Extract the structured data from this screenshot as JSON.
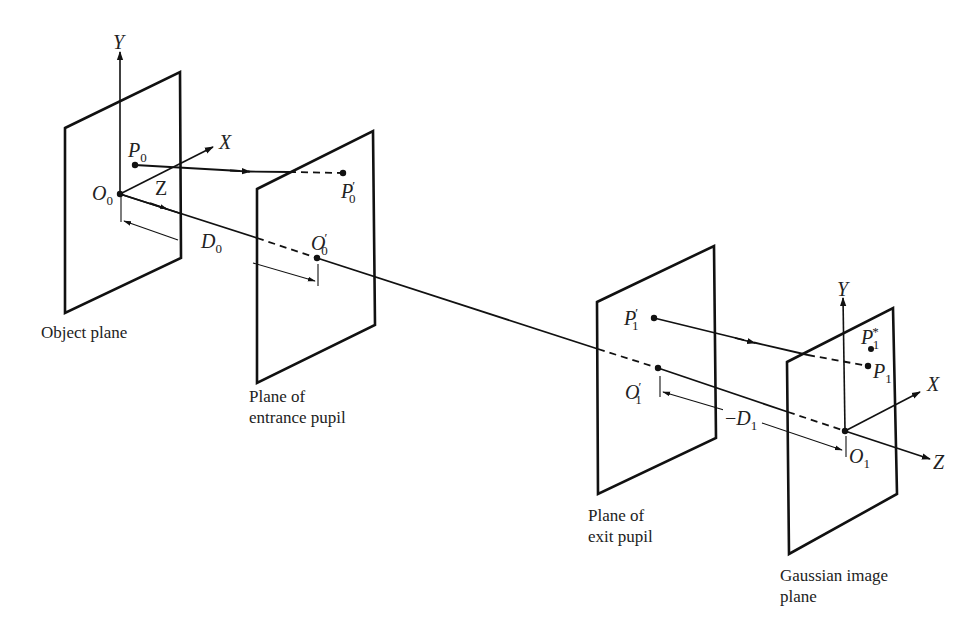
{
  "figure": {
    "type": "optical-system-schematic",
    "planes": [
      {
        "id": "object",
        "caption": "Object plane"
      },
      {
        "id": "entrance",
        "caption_line1": "Plane of",
        "caption_line2": "entrance pupil"
      },
      {
        "id": "exit",
        "caption_line1": "Plane of",
        "caption_line2": "exit pupil"
      },
      {
        "id": "image",
        "caption_line1": "Gaussian image",
        "caption_line2": "plane"
      }
    ],
    "object_axes": {
      "y": "Y",
      "x": "X",
      "z": "Z"
    },
    "image_axes": {
      "y": "Y",
      "x": "X",
      "z": "Z"
    },
    "points": {
      "O0": {
        "base": "O",
        "sub": "0",
        "prime": ""
      },
      "P0": {
        "base": "P",
        "sub": "0",
        "prime": ""
      },
      "P0p": {
        "base": "P",
        "sub": "0",
        "prime": "′"
      },
      "O0p": {
        "base": "O",
        "sub": "0",
        "prime": "′"
      },
      "P1p": {
        "base": "P",
        "sub": "1",
        "prime": "′"
      },
      "O1p": {
        "base": "O",
        "sub": "1",
        "prime": "′"
      },
      "P1s": {
        "base": "P",
        "sub": "1",
        "prime": "*"
      },
      "P1": {
        "base": "P",
        "sub": "1",
        "prime": ""
      },
      "O1": {
        "base": "O",
        "sub": "1",
        "prime": ""
      }
    },
    "distances": {
      "D0": {
        "base": "D",
        "sub": "0",
        "sign": ""
      },
      "D1": {
        "base": "D",
        "sub": "1",
        "sign": "−"
      }
    }
  }
}
